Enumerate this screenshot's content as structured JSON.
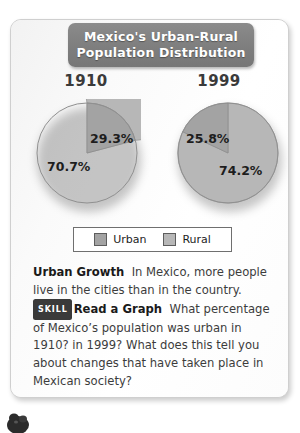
{
  "title": {
    "line1": "Mexico's Urban-Rural",
    "line2": "Population Distribution"
  },
  "colors": {
    "urban": "#a3a3a3",
    "rural": "#b7b7b7",
    "banner": "#7e7e7e",
    "badge": "#3a3a3a",
    "text": "#3c3c3c"
  },
  "chart_data": {
    "type": "pie",
    "legend": [
      "Urban",
      "Rural"
    ],
    "legend_position": "bottom",
    "unit": "%",
    "charts": [
      {
        "label": "1910",
        "categories": [
          "Urban",
          "Rural"
        ],
        "values": [
          29.3,
          70.7
        ],
        "labels": [
          "29.3%",
          "70.7%"
        ]
      },
      {
        "label": "1999",
        "categories": [
          "Urban",
          "Rural"
        ],
        "values": [
          25.8,
          74.2
        ],
        "labels": [
          "25.8%",
          "74.2%"
        ]
      }
    ]
  },
  "legend": {
    "urban_label": "Urban",
    "rural_label": "Rural"
  },
  "body": {
    "lead": "Urban Growth",
    "lead_text": "In Mexico, more people live in the cities than in the country.",
    "skill_badge": "SKILL",
    "skill_lead": "Read a Graph",
    "skill_text": "What percentage of Mexico’s population was urban in 1910? in 1999?  What does this tell you about changes that have taken place in Mexican society?"
  }
}
